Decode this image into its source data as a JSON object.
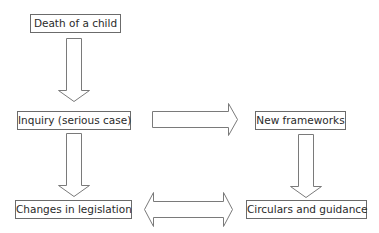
{
  "diagram": {
    "type": "flowchart",
    "nodes": [
      {
        "id": "death",
        "label": "Death of a child"
      },
      {
        "id": "inquiry",
        "label": "Inquiry (serious case)"
      },
      {
        "id": "frameworks",
        "label": "New frameworks"
      },
      {
        "id": "legislation",
        "label": "Changes in legislation"
      },
      {
        "id": "circulars",
        "label": "Circulars and guidance"
      }
    ],
    "edges": [
      {
        "from": "death",
        "to": "inquiry",
        "style": "block-arrow-down"
      },
      {
        "from": "inquiry",
        "to": "frameworks",
        "style": "block-arrow-right"
      },
      {
        "from": "inquiry",
        "to": "legislation",
        "style": "block-arrow-down"
      },
      {
        "from": "frameworks",
        "to": "circulars",
        "style": "block-arrow-down"
      },
      {
        "from": "legislation",
        "to": "circulars",
        "style": "block-arrow-bidirectional"
      }
    ],
    "colors": {
      "border": "#6b6b6b",
      "text": "#2a2a2a",
      "arrow_stroke": "#7a7a7a",
      "background": "#ffffff"
    }
  }
}
